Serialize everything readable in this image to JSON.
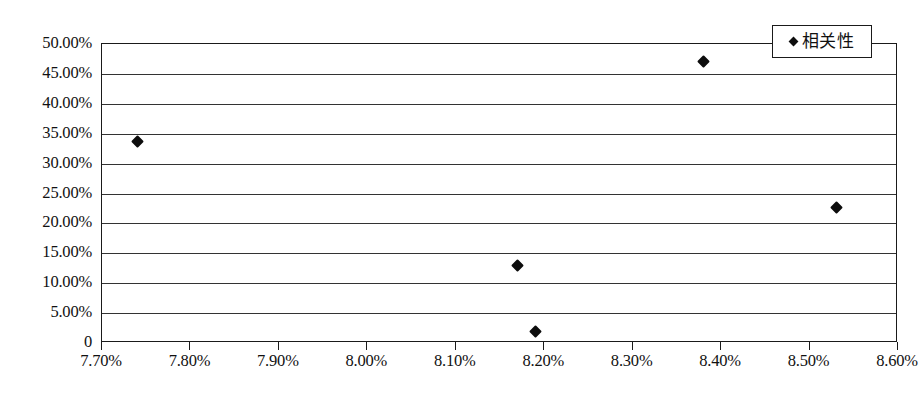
{
  "chart_data": {
    "type": "scatter",
    "title": "",
    "xlabel": "",
    "ylabel": "",
    "xlim": [
      7.7,
      8.6
    ],
    "ylim": [
      0,
      50
    ],
    "grid": true,
    "legend_position": "top-right",
    "x_tick_labels": [
      "7.70%",
      "7.80%",
      "7.90%",
      "8.00%",
      "8.10%",
      "8.20%",
      "8.30%",
      "8.40%",
      "8.50%",
      "8.60%"
    ],
    "x_tick_values": [
      7.7,
      7.8,
      7.9,
      8.0,
      8.1,
      8.2,
      8.3,
      8.4,
      8.5,
      8.6
    ],
    "y_tick_labels": [
      "50.00%",
      "45.00%",
      "40.00%",
      "35.00%",
      "30.00%",
      "25.00%",
      "20.00%",
      "15.00%",
      "10.00%",
      "5.00%",
      "0"
    ],
    "y_tick_values": [
      50,
      45,
      40,
      35,
      30,
      25,
      20,
      15,
      10,
      5,
      0
    ],
    "series": [
      {
        "name": "相关性",
        "marker": "diamond",
        "color": "#0d0d0d",
        "points": [
          {
            "x": 7.74,
            "y": 33.7
          },
          {
            "x": 8.17,
            "y": 12.9
          },
          {
            "x": 8.19,
            "y": 2.0
          },
          {
            "x": 8.38,
            "y": 47.0
          },
          {
            "x": 8.53,
            "y": 22.7
          }
        ]
      }
    ]
  },
  "legend": {
    "entries": [
      {
        "label": "相关性",
        "marker": "diamond"
      }
    ]
  },
  "caption": {
    "text": ""
  }
}
